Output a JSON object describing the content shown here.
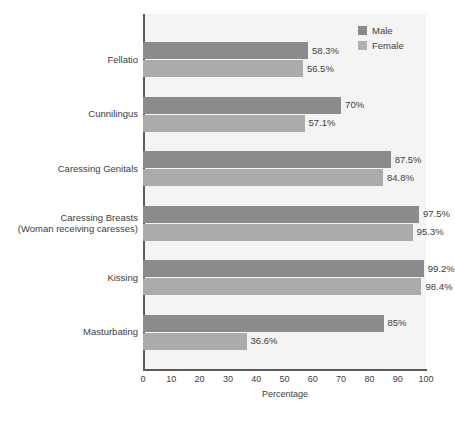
{
  "chart_data": {
    "type": "bar",
    "orientation": "horizontal",
    "title": "",
    "xlabel": "Percentage",
    "ylabel": "",
    "xlim": [
      0,
      100
    ],
    "xticks": [
      0,
      10,
      20,
      30,
      40,
      50,
      60,
      70,
      80,
      90,
      100
    ],
    "xtick_labels": [
      "0",
      "10",
      "20",
      "30",
      "40",
      "50",
      "60",
      "70",
      "80",
      "90",
      "100"
    ],
    "grid": false,
    "legend_position": "top-right",
    "categories": [
      "Fellatio",
      "Cunnilingus",
      "Caressing Genitals",
      "Caressing Breasts (Woman receiving caresses)",
      "Kissing",
      "Masturbating"
    ],
    "category_lines": [
      [
        "Fellatio"
      ],
      [
        "Cunnilingus"
      ],
      [
        "Caressing Genitals"
      ],
      [
        "Caressing Breasts",
        "(Woman receiving caresses)"
      ],
      [
        "Kissing"
      ],
      [
        "Masturbating"
      ]
    ],
    "series": [
      {
        "name": "Male",
        "color": "#8b8b8b",
        "values": [
          58.3,
          70,
          87.5,
          97.5,
          99.2,
          85
        ],
        "labels": [
          "58.3%",
          "70%",
          "87.5%",
          "97.5%",
          "99.2%",
          "85%"
        ]
      },
      {
        "name": "Female",
        "color": "#ababab",
        "values": [
          56.5,
          57.1,
          84.8,
          95.3,
          98.4,
          36.6
        ],
        "labels": [
          "56.5%",
          "57.1%",
          "84.8%",
          "95.3%",
          "98.4%",
          "36.6%"
        ]
      }
    ]
  },
  "legend": {
    "items": [
      {
        "label": "Male",
        "color": "#8b8b8b"
      },
      {
        "label": "Female",
        "color": "#b1b1b1"
      }
    ]
  },
  "axis": {
    "x_label": "Percentage"
  },
  "colors": {
    "male": "#8b8b8b",
    "female": "#ababab",
    "plot_background": "#f4f4f4",
    "page_background": "#ffffff",
    "axis": "#5c5c5c",
    "text": "#3d3d3d"
  }
}
